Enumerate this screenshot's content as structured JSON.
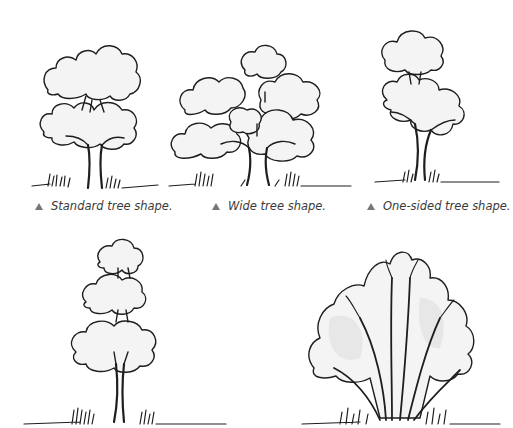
{
  "figures": [
    {
      "id": "standard",
      "caption": "Standard tree shape.",
      "marker": "triangle-icon"
    },
    {
      "id": "wide",
      "caption": "Wide tree shape.",
      "marker": "triangle-icon"
    },
    {
      "id": "one-sided",
      "caption": "One-sided tree shape.",
      "marker": "triangle-icon"
    },
    {
      "id": "tiered",
      "caption": ""
    },
    {
      "id": "vase",
      "caption": ""
    }
  ],
  "colors": {
    "ink": "#1e1e1e",
    "caption_text": "#3a3a3a",
    "marker": "#777777",
    "background": "#ffffff"
  }
}
